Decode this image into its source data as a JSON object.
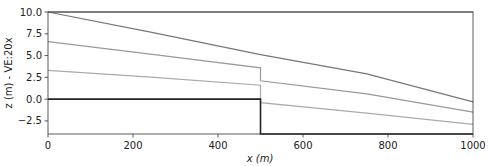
{
  "chart_data": {
    "type": "line",
    "title": "",
    "xlabel": "x (m)",
    "ylabel": "z (m) - VE:20x",
    "xlim": [
      0,
      1000
    ],
    "ylim": [
      -4.0,
      10.0
    ],
    "xticks": [
      0,
      200,
      400,
      600,
      800,
      1000
    ],
    "xtick_labels": [
      "0",
      "200",
      "400",
      "600",
      "800",
      "1000"
    ],
    "yticks": [
      -2.5,
      0.0,
      2.5,
      5.0,
      7.5,
      10.0
    ],
    "ytick_labels": [
      "−2.5",
      "0.0",
      "2.5",
      "5.0",
      "7.5",
      "10.0"
    ],
    "grid": false,
    "legend": null,
    "series": [
      {
        "name": "water-table",
        "color": "#666666",
        "x": [
          0,
          1000
        ],
        "y": [
          10.0,
          10.0
        ]
      },
      {
        "name": "head-top",
        "color": "#777777",
        "x": [
          0,
          250,
          500,
          750,
          1000
        ],
        "y": [
          10.0,
          7.6,
          5.1,
          2.9,
          -0.3
        ]
      },
      {
        "name": "head-mid",
        "color": "#999999",
        "x": [
          0,
          250,
          500,
          500,
          750,
          1000
        ],
        "y": [
          6.6,
          5.1,
          3.6,
          2.1,
          0.6,
          -1.5
        ]
      },
      {
        "name": "head-low",
        "color": "#aaaaaa",
        "x": [
          0,
          250,
          500,
          500,
          750,
          1000
        ],
        "y": [
          3.3,
          2.5,
          1.6,
          -0.4,
          -1.6,
          -2.9
        ]
      },
      {
        "name": "bedrock",
        "color": "#222222",
        "x": [
          0,
          500,
          500,
          1000
        ],
        "y": [
          0.0,
          0.0,
          -4.0,
          -4.0
        ]
      }
    ]
  }
}
